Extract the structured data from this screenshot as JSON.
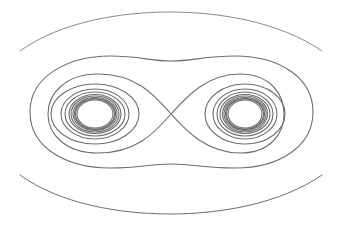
{
  "diagram": {
    "type": "phase-portrait",
    "colors": {
      "background": "#ffffff",
      "stroke": "#6e6e6e",
      "outer_stroke": "#8a8a8a"
    },
    "saddle_point": {
      "x": 171,
      "y": 114
    },
    "centers": [
      {
        "x": 95,
        "y": 114
      },
      {
        "x": 245,
        "y": 114
      }
    ],
    "left_rings": [
      {
        "rx": 44,
        "ry": 30
      },
      {
        "rx": 34,
        "ry": 25
      },
      {
        "rx": 30,
        "ry": 22
      },
      {
        "rx": 26,
        "ry": 19.5
      },
      {
        "rx": 24,
        "ry": 18
      },
      {
        "rx": 22,
        "ry": 16.5
      },
      {
        "rx": 20.5,
        "ry": 15.5
      },
      {
        "rx": 19.5,
        "ry": 15
      },
      {
        "rx": 18,
        "ry": 14
      }
    ],
    "right_rings": [
      {
        "rx": 40,
        "ry": 30
      },
      {
        "rx": 32,
        "ry": 25
      },
      {
        "rx": 28,
        "ry": 22
      },
      {
        "rx": 25,
        "ry": 19.5
      },
      {
        "rx": 22.5,
        "ry": 18
      },
      {
        "rx": 21,
        "ry": 16.5
      },
      {
        "rx": 19.5,
        "ry": 15.5
      },
      {
        "rx": 18.5,
        "ry": 15
      },
      {
        "rx": 17,
        "ry": 14
      }
    ]
  }
}
